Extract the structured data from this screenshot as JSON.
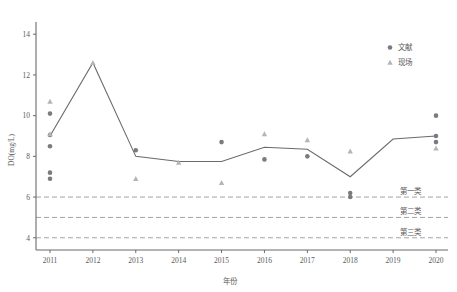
{
  "chart_data": {
    "type": "line",
    "title": "",
    "xlabel": "年份",
    "ylabel": "DO(mg/L)",
    "x": [
      2011,
      2012,
      2013,
      2014,
      2015,
      2016,
      2017,
      2018,
      2019,
      2020
    ],
    "xtick_labels": [
      "2011",
      "2012",
      "2013",
      "2014",
      "2015",
      "2016",
      "2017",
      "2018",
      "2019",
      "2020"
    ],
    "ytick_labels": [
      "4",
      "6",
      "8",
      "10",
      "12",
      "14"
    ],
    "yticks": [
      4,
      6,
      8,
      10,
      12,
      14
    ],
    "ylim": [
      3.4,
      14.6
    ],
    "grid": false,
    "legend_position": "top-right",
    "series": [
      {
        "name": "trend-line",
        "label": "",
        "type": "line",
        "color": "#6b6b6b",
        "values": [
          9.0,
          12.6,
          8.0,
          7.75,
          7.75,
          8.45,
          8.35,
          7.0,
          8.85,
          9.0
        ]
      },
      {
        "name": "文献",
        "label": "文献",
        "type": "scatter",
        "marker": "circle",
        "color": "#7a7a80",
        "points": [
          {
            "x": 2011,
            "y": 10.1
          },
          {
            "x": 2011,
            "y": 9.05
          },
          {
            "x": 2011,
            "y": 8.5
          },
          {
            "x": 2011,
            "y": 7.2
          },
          {
            "x": 2011,
            "y": 6.9
          },
          {
            "x": 2013,
            "y": 8.3
          },
          {
            "x": 2015,
            "y": 8.7
          },
          {
            "x": 2016,
            "y": 7.85
          },
          {
            "x": 2017,
            "y": 8.0
          },
          {
            "x": 2018,
            "y": 6.2
          },
          {
            "x": 2018,
            "y": 6.0
          },
          {
            "x": 2020,
            "y": 10.0
          },
          {
            "x": 2020,
            "y": 9.0
          },
          {
            "x": 2020,
            "y": 8.7
          }
        ]
      },
      {
        "name": "现场",
        "label": "现场",
        "type": "scatter",
        "marker": "triangle",
        "color": "#b4b4ba",
        "points": [
          {
            "x": 2011,
            "y": 10.7
          },
          {
            "x": 2011,
            "y": 9.1
          },
          {
            "x": 2012,
            "y": 12.6
          },
          {
            "x": 2013,
            "y": 6.9
          },
          {
            "x": 2014,
            "y": 7.7
          },
          {
            "x": 2015,
            "y": 6.7
          },
          {
            "x": 2016,
            "y": 9.1
          },
          {
            "x": 2017,
            "y": 8.8
          },
          {
            "x": 2018,
            "y": 8.25
          },
          {
            "x": 2020,
            "y": 8.4
          }
        ]
      }
    ],
    "reference_lines": [
      {
        "name": "第一类",
        "label": "第一类",
        "value": 6,
        "style": "dashed",
        "color": "#9a9a9a"
      },
      {
        "name": "第二类",
        "label": "第二类",
        "value": 5,
        "style": "dashed",
        "color": "#9a9a9a"
      },
      {
        "name": "第三类",
        "label": "第三类",
        "value": 4,
        "style": "dashed",
        "color": "#9a9a9a"
      }
    ],
    "legend": [
      {
        "label": "文献",
        "marker": "circle",
        "color": "#7a7a80"
      },
      {
        "label": "现场",
        "marker": "triangle",
        "color": "#b4b4ba"
      }
    ]
  }
}
